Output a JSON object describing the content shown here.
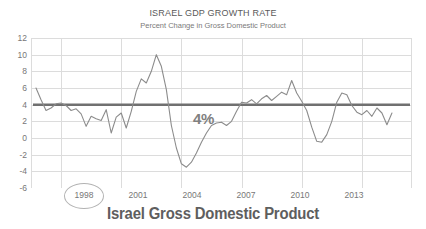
{
  "chart_data": {
    "type": "line",
    "title": "ISRAEL GDP GROWTH RATE",
    "subtitle": "Percent Change in Gross Domestic Product",
    "caption": "Israel Gross Domestic Product",
    "xlabel": "",
    "ylabel": "",
    "ylim": [
      -6,
      12
    ],
    "xlim": [
      1996.5,
      2015.5
    ],
    "grid": true,
    "legend_position": "none",
    "line_color": "#8c8c8c",
    "grid_color": "#dcdcdc",
    "reference_line": {
      "value": 4,
      "label": "4%",
      "color": "#707070"
    },
    "annotations": [
      {
        "text": "1998",
        "type": "circled-x-tick",
        "color": "#b3b3b3"
      }
    ],
    "ytick_labels": [
      "12",
      "10",
      "8",
      "6",
      "4",
      "2",
      "0",
      "-2",
      "-4",
      "-6"
    ],
    "ytick_values": [
      12,
      10,
      8,
      6,
      4,
      2,
      0,
      -2,
      -4,
      -6
    ],
    "xtick_labels": [
      "1998",
      "2001",
      "2004",
      "2007",
      "2010",
      "2013"
    ],
    "xtick_values": [
      1998,
      2001,
      2004,
      2007,
      2010,
      2013
    ],
    "series": [
      {
        "name": "Israel GDP Growth Rate",
        "x": [
          1996.75,
          1997.0,
          1997.25,
          1997.5,
          1997.75,
          1998.0,
          1998.25,
          1998.5,
          1998.75,
          1999.0,
          1999.25,
          1999.5,
          1999.75,
          2000.0,
          2000.25,
          2000.5,
          2000.75,
          2001.0,
          2001.25,
          2001.5,
          2001.75,
          2002.0,
          2002.25,
          2002.5,
          2002.75,
          2003.0,
          2003.25,
          2003.5,
          2003.75,
          2004.0,
          2004.25,
          2004.5,
          2004.75,
          2005.0,
          2005.25,
          2005.5,
          2005.75,
          2006.0,
          2006.25,
          2006.5,
          2006.75,
          2007.0,
          2007.25,
          2007.5,
          2007.75,
          2008.0,
          2008.25,
          2008.5,
          2008.75,
          2009.0,
          2009.25,
          2009.5,
          2009.75,
          2010.0,
          2010.25,
          2010.5,
          2010.75,
          2011.0,
          2011.25,
          2011.5,
          2011.75,
          2012.0,
          2012.25,
          2012.5,
          2012.75,
          2013.0,
          2013.25,
          2013.5,
          2013.75,
          2014.0,
          2014.25,
          2014.5
        ],
        "y": [
          6.0,
          4.6,
          3.3,
          3.6,
          4.1,
          4.2,
          3.9,
          3.3,
          3.5,
          2.9,
          1.4,
          2.6,
          2.3,
          2.1,
          3.4,
          0.6,
          2.5,
          3.0,
          1.2,
          3.2,
          5.6,
          7.1,
          6.6,
          8.0,
          10.0,
          8.6,
          5.8,
          1.5,
          -1.2,
          -3.1,
          -3.5,
          -2.9,
          -1.8,
          -0.5,
          0.6,
          1.5,
          1.8,
          1.9,
          1.5,
          2.0,
          3.2,
          4.3,
          4.2,
          4.6,
          4.1,
          4.7,
          5.1,
          4.5,
          5.0,
          5.5,
          5.2,
          6.9,
          5.4,
          4.4,
          3.3,
          1.3,
          -0.4,
          -0.5,
          0.4,
          2.0,
          4.3,
          5.4,
          5.2,
          3.9,
          3.1,
          2.8,
          3.3,
          2.6,
          3.6,
          3.0,
          1.6,
          3.0
        ]
      }
    ]
  }
}
